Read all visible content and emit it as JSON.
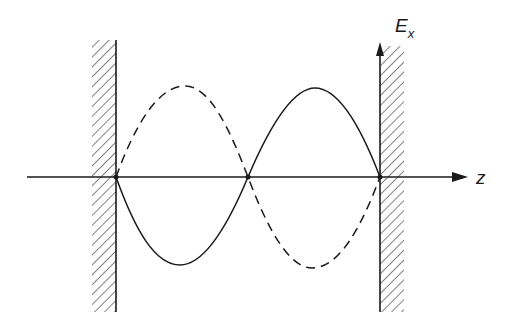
{
  "diagram": {
    "axes": {
      "horizontal": {
        "label": "z"
      },
      "vertical": {
        "label_main": "E",
        "label_sub": "x"
      }
    },
    "walls": [
      {
        "name": "left-wall",
        "x": 116
      },
      {
        "name": "right-wall",
        "x": 380
      }
    ],
    "curves": [
      {
        "name": "solid-curve",
        "style": "solid"
      },
      {
        "name": "dashed-curve",
        "style": "dashed"
      }
    ],
    "nodes": 3,
    "colors": {
      "ink": "#1a1a1a",
      "background": "#ffffff"
    }
  }
}
